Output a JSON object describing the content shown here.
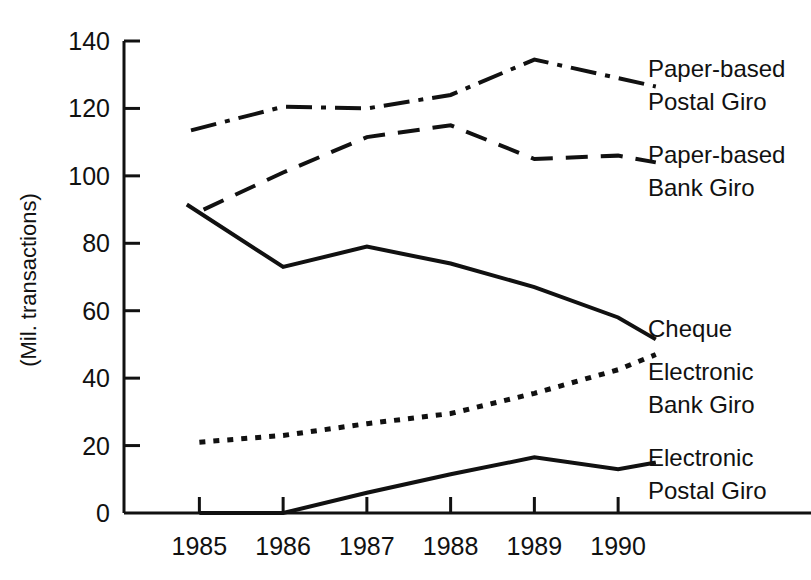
{
  "chart_data": {
    "type": "line",
    "title": "",
    "xlabel": "",
    "ylabel": "(Mil. transactions)",
    "xlim": [
      1984.1,
      1990.5
    ],
    "ylim": [
      0,
      140
    ],
    "ytick_values": [
      0,
      20,
      40,
      60,
      80,
      100,
      120,
      140
    ],
    "ytick_labels": [
      "0",
      "20",
      "40",
      "60",
      "80",
      "100",
      "120",
      "140"
    ],
    "xtick_values": [
      1985,
      1986,
      1987,
      1988,
      1989,
      1990
    ],
    "xtick_labels": [
      "1985",
      "1986",
      "1987",
      "1988",
      "1989",
      "1990"
    ],
    "grid": false,
    "legend_position": "right-inline",
    "series": [
      {
        "name": "Paper-based Postal Giro",
        "label_lines": [
          "Paper-based",
          "Postal Giro"
        ],
        "style": "dash-dot",
        "x": [
          1984.9,
          1986.0,
          1987.0,
          1988.0,
          1989.0,
          1990.0,
          1990.45
        ],
        "values": [
          113.5,
          120.5,
          120.0,
          124.0,
          134.5,
          129.0,
          126.5
        ]
      },
      {
        "name": "Paper-based Bank Giro",
        "label_lines": [
          "Paper-based",
          "Bank Giro"
        ],
        "style": "dashed",
        "x": [
          1985.05,
          1986.0,
          1987.0,
          1988.0,
          1989.0,
          1990.0,
          1990.45
        ],
        "values": [
          90.0,
          101.0,
          111.5,
          115.0,
          105.0,
          106.0,
          104.0
        ]
      },
      {
        "name": "Cheque",
        "label_lines": [
          "Cheque"
        ],
        "style": "solid",
        "x": [
          1984.85,
          1986.0,
          1987.0,
          1988.0,
          1989.0,
          1990.0,
          1990.45
        ],
        "values": [
          91.5,
          73.0,
          79.0,
          74.0,
          67.0,
          58.0,
          51.5
        ]
      },
      {
        "name": "Electronic Bank Giro",
        "label_lines": [
          "Electronic",
          "Bank Giro"
        ],
        "style": "dotted",
        "x": [
          1985.0,
          1986.0,
          1987.0,
          1988.0,
          1989.0,
          1990.0,
          1990.45
        ],
        "values": [
          21.0,
          23.0,
          26.5,
          29.5,
          35.5,
          42.5,
          47.0
        ]
      },
      {
        "name": "Electronic Postal Giro",
        "label_lines": [
          "Electronic",
          "Postal Giro"
        ],
        "style": "solid",
        "x": [
          1985.0,
          1986.0,
          1987.0,
          1988.0,
          1989.0,
          1990.0,
          1990.45
        ],
        "values": [
          0.0,
          0.0,
          6.0,
          11.5,
          16.5,
          13.0,
          15.0
        ]
      }
    ]
  },
  "axis": {
    "y_title": "(Mil. transactions)"
  },
  "legend": {
    "postal_giro_line1": "Paper-based",
    "postal_giro_line2": "Postal Giro",
    "bank_giro_line1": "Paper-based",
    "bank_giro_line2": "Bank Giro",
    "cheque_line1": "Cheque",
    "elec_bank_line1": "Electronic",
    "elec_bank_line2": "Bank Giro",
    "elec_postal_line1": "Electronic",
    "elec_postal_line2": "Postal Giro"
  },
  "colors": {
    "ink": "#111111",
    "background": "#ffffff"
  }
}
